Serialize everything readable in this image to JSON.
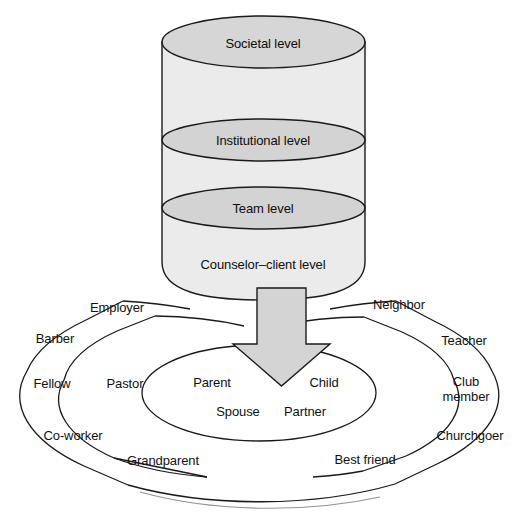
{
  "diagram": {
    "type": "funnel-and-concentric-ellipses",
    "colors": {
      "cylinder_body": "#ebebeb",
      "cylinder_band": "#d3d3d3",
      "arrow_fill": "#d4d4d4",
      "stroke": "#1a1a1a",
      "text": "#111111",
      "background": "#ffffff"
    },
    "cylinder": {
      "name": "levels-cylinder",
      "levels": [
        {
          "id": "societal",
          "label": "Societal level"
        },
        {
          "id": "institutional",
          "label": "Institutional level"
        },
        {
          "id": "team",
          "label": "Team level"
        },
        {
          "id": "counselor-client",
          "label": "Counselor–client level"
        }
      ]
    },
    "arrow": {
      "name": "downward-arrow",
      "direction": "down"
    },
    "rings": [
      {
        "id": "inner-ring",
        "name": "inner-relationship-ring",
        "labels": [
          {
            "id": "parent",
            "text": "Parent"
          },
          {
            "id": "child",
            "text": "Child"
          },
          {
            "id": "spouse",
            "text": "Spouse"
          },
          {
            "id": "partner",
            "text": "Partner"
          }
        ]
      },
      {
        "id": "middle-ring",
        "name": "middle-relationship-ring",
        "labels": [
          {
            "id": "pastor",
            "text": "Pastor"
          },
          {
            "id": "employer",
            "text": "Employer"
          },
          {
            "id": "neighbor",
            "text": "Neighbor"
          },
          {
            "id": "grandparent",
            "text": "Grandparent"
          },
          {
            "id": "best-friend",
            "text": "Best friend"
          }
        ]
      },
      {
        "id": "outer-ring",
        "name": "outer-relationship-ring",
        "labels": [
          {
            "id": "barber",
            "text": "Barber"
          },
          {
            "id": "fellow",
            "text": "Fellow"
          },
          {
            "id": "co-worker",
            "text": "Co-worker"
          },
          {
            "id": "teacher",
            "text": "Teacher"
          },
          {
            "id": "club-member",
            "text": "Club\nmember",
            "line1": "Club",
            "line2": "member"
          },
          {
            "id": "churchgoer",
            "text": "Churchgoer"
          }
        ]
      }
    ]
  }
}
